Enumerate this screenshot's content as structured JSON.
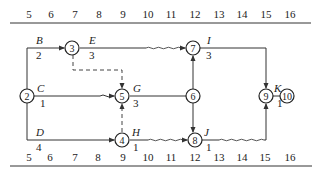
{
  "diagram": {
    "type": "time-scaled network diagram",
    "axis_ticks": [
      "5",
      "6",
      "7",
      "8",
      "9",
      "10",
      "11",
      "12",
      "13",
      "14",
      "15",
      "16"
    ],
    "nodes": [
      "2",
      "3",
      "4",
      "5",
      "6",
      "7",
      "8",
      "9",
      "10"
    ],
    "activities": [
      {
        "name": "B",
        "duration": "2",
        "from": "2",
        "to": "3"
      },
      {
        "name": "C",
        "duration": "1",
        "from": "2",
        "to": "5"
      },
      {
        "name": "D",
        "duration": "4",
        "from": "2",
        "to": "4"
      },
      {
        "name": "E",
        "duration": "3",
        "from": "3",
        "to": "7"
      },
      {
        "name": "G",
        "duration": "3",
        "from": "5",
        "to": "6"
      },
      {
        "name": "H",
        "duration": "1",
        "from": "4",
        "to": "8"
      },
      {
        "name": "I",
        "duration": "3",
        "from": "7",
        "to": "9"
      },
      {
        "name": "J",
        "duration": "1",
        "from": "8",
        "to": "9"
      },
      {
        "name": "K",
        "duration": "1",
        "from": "9",
        "to": "10"
      }
    ],
    "dummy_activities": [
      {
        "from": "3",
        "to": "5"
      },
      {
        "from": "4",
        "to": "5"
      }
    ]
  }
}
